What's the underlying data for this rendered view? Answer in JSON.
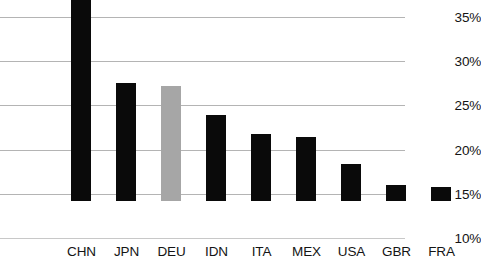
{
  "chart_data": {
    "type": "bar",
    "title": "",
    "xlabel": "",
    "ylabel": "",
    "categories": [
      "CHN",
      "JPN",
      "DEU",
      "IDN",
      "ITA",
      "MEX",
      "USA",
      "GBR",
      "FRA"
    ],
    "values": [
      34.2,
      23.4,
      23.0,
      19.7,
      17.6,
      17.2,
      14.2,
      11.8,
      11.6
    ],
    "value_format": "percent",
    "ylim": [
      10,
      35
    ],
    "ytick_values": [
      35,
      30,
      25,
      20,
      15,
      10
    ],
    "ytick_labels": [
      "35%",
      "30%",
      "25%",
      "20%",
      "15%",
      "10%"
    ],
    "grid": true,
    "grid_axis": "y",
    "legend": "none",
    "bar_colors": [
      "#0a0a0a",
      "#0a0a0a",
      "#a6a6a6",
      "#0a0a0a",
      "#0a0a0a",
      "#0a0a0a",
      "#0a0a0a",
      "#0a0a0a",
      "#0a0a0a"
    ],
    "highlighted_category": "DEU",
    "colors": {
      "bar_default": "#0a0a0a",
      "bar_highlight": "#a6a6a6",
      "gridline": "#b4b4b4",
      "text": "#141414",
      "background": "#ffffff"
    }
  }
}
